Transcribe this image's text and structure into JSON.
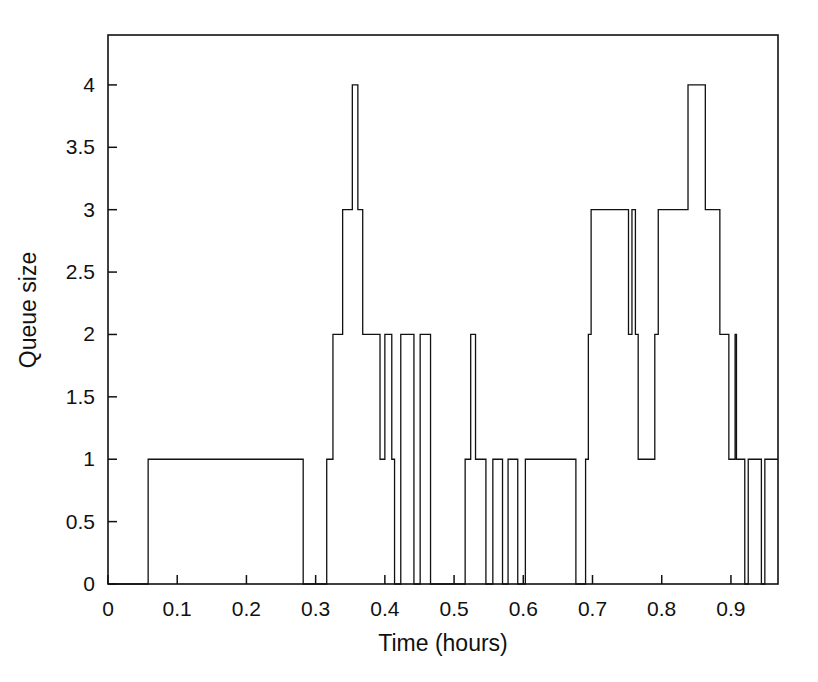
{
  "chart_data": {
    "type": "line",
    "subtype": "step-post",
    "title": "",
    "xlabel": "Time (hours)",
    "ylabel": "Queue size",
    "xlim": [
      0,
      0.968
    ],
    "ylim": [
      0,
      4.4
    ],
    "xticks": [
      0,
      0.1,
      0.2,
      0.3,
      0.4,
      0.5,
      0.6,
      0.7,
      0.8,
      0.9
    ],
    "xticklabels": [
      "0",
      "0.1",
      "0.2",
      "0.3",
      "0.4",
      "0.5",
      "0.6",
      "0.7",
      "0.8",
      "0.9"
    ],
    "yticks": [
      0,
      0.5,
      1,
      1.5,
      2,
      2.5,
      3,
      3.5,
      4
    ],
    "yticklabels": [
      "0",
      "0.5",
      "1",
      "1.5",
      "2",
      "2.5",
      "3",
      "3.5",
      "4"
    ],
    "grid": false,
    "legend": null,
    "line_color": "#111111",
    "line_width": 1.3,
    "background": "#ffffff",
    "box_frame": true,
    "series": [
      {
        "name": "Queue size",
        "step_points": [
          [
            0.0,
            0
          ],
          [
            0.058,
            1
          ],
          [
            0.282,
            0
          ],
          [
            0.316,
            1
          ],
          [
            0.325,
            2
          ],
          [
            0.339,
            3
          ],
          [
            0.353,
            4
          ],
          [
            0.361,
            3
          ],
          [
            0.368,
            2
          ],
          [
            0.393,
            1
          ],
          [
            0.4,
            2
          ],
          [
            0.41,
            1
          ],
          [
            0.414,
            0
          ],
          [
            0.423,
            2
          ],
          [
            0.442,
            0
          ],
          [
            0.451,
            2
          ],
          [
            0.466,
            0
          ],
          [
            0.516,
            1
          ],
          [
            0.524,
            2
          ],
          [
            0.531,
            1
          ],
          [
            0.546,
            0
          ],
          [
            0.556,
            1
          ],
          [
            0.57,
            0
          ],
          [
            0.578,
            1
          ],
          [
            0.592,
            0
          ],
          [
            0.603,
            1
          ],
          [
            0.676,
            0
          ],
          [
            0.69,
            1
          ],
          [
            0.694,
            2
          ],
          [
            0.698,
            3
          ],
          [
            0.752,
            2
          ],
          [
            0.757,
            3
          ],
          [
            0.762,
            2
          ],
          [
            0.766,
            1
          ],
          [
            0.79,
            2
          ],
          [
            0.795,
            3
          ],
          [
            0.838,
            4
          ],
          [
            0.863,
            3
          ],
          [
            0.884,
            2
          ],
          [
            0.897,
            1
          ],
          [
            0.906,
            2
          ],
          [
            0.908,
            1
          ],
          [
            0.92,
            0
          ],
          [
            0.925,
            1
          ],
          [
            0.944,
            0
          ],
          [
            0.949,
            1
          ],
          [
            0.968,
            1
          ]
        ]
      }
    ]
  }
}
